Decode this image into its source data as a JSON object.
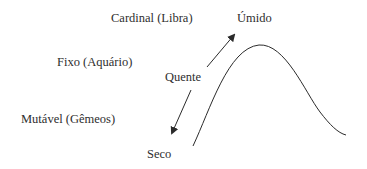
{
  "diagram": {
    "modalities": [
      {
        "id": "cardinal",
        "label": "Cardinal (Libra)"
      },
      {
        "id": "fixo",
        "label": "Fixo (Aquário)"
      },
      {
        "id": "mutavel",
        "label": "Mutável (Gêmeos)"
      }
    ],
    "qualities": {
      "top": "Úmido",
      "middle": "Quente",
      "bottom": "Seco"
    },
    "arrows": [
      {
        "id": "arrow-to-umido",
        "from": "Quente",
        "to": "Úmido",
        "direction": "up-right"
      },
      {
        "id": "arrow-to-seco",
        "from": "Quente",
        "to": "Seco",
        "direction": "down-left"
      }
    ],
    "curve": {
      "shape": "bell-like wave",
      "start": [
        193,
        146
      ],
      "peak": [
        259,
        45
      ],
      "end": [
        346,
        135
      ]
    },
    "colors": {
      "line": "#2b2b2b",
      "text": "#2e2e2e",
      "background": "#ffffff"
    }
  }
}
